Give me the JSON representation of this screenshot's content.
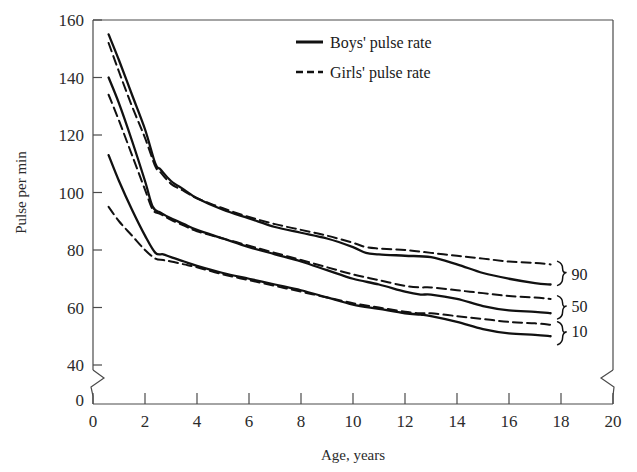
{
  "chart_data": {
    "type": "line",
    "title": "",
    "xlabel": "Age, years",
    "ylabel": "Pulse per min",
    "xlim": [
      0,
      20
    ],
    "ylim": [
      40,
      160
    ],
    "grid": false,
    "y_axis_break": true,
    "x_axis_break": true,
    "y_break_from": 0,
    "y_break_to": 40,
    "xticks": [
      0,
      2,
      4,
      6,
      8,
      10,
      12,
      14,
      16,
      18,
      20
    ],
    "xtick_labels": [
      "0",
      "2",
      "4",
      "6",
      "8",
      "10",
      "12",
      "14",
      "16",
      "18",
      "20"
    ],
    "yticks": [
      40,
      60,
      80,
      100,
      120,
      140,
      160
    ],
    "ytick_labels": [
      "40",
      "60",
      "80",
      "100",
      "120",
      "140",
      "160"
    ],
    "origin_label": "0",
    "legend": {
      "position": "top-center-right",
      "entries": [
        {
          "label": "Boys' pulse rate",
          "style": "solid"
        },
        {
          "label": "Girls' pulse rate",
          "style": "dashed"
        }
      ]
    },
    "band_labels": [
      {
        "text": "90",
        "percentile": 90
      },
      {
        "text": "50",
        "percentile": 50
      },
      {
        "text": "10",
        "percentile": 10
      }
    ],
    "series": [
      {
        "name": "Boys' pulse rate",
        "percentile": 90,
        "style": "solid",
        "x": [
          0.6,
          1.0,
          1.5,
          2.0,
          2.4,
          2.6,
          3.0,
          3.5,
          4.0,
          5.0,
          6.0,
          7.0,
          8.0,
          9.0,
          10.0,
          10.5,
          11.0,
          12.0,
          13.0,
          14.0,
          15.0,
          16.0,
          17.0,
          17.6
        ],
        "values": [
          155,
          146,
          134,
          122,
          110,
          108,
          104,
          101,
          98,
          94,
          91,
          88,
          86,
          84,
          81,
          79,
          78.5,
          78,
          77.5,
          75,
          72,
          70,
          68.5,
          68
        ]
      },
      {
        "name": "Girls' pulse rate",
        "percentile": 90,
        "style": "dashed",
        "x": [
          0.6,
          1.0,
          1.5,
          2.0,
          2.4,
          2.6,
          3.0,
          3.5,
          4.0,
          5.0,
          6.0,
          7.0,
          8.0,
          9.0,
          10.0,
          10.5,
          11.0,
          12.0,
          13.0,
          14.0,
          15.0,
          16.0,
          17.0,
          17.6
        ],
        "values": [
          152,
          142,
          130,
          119,
          109,
          107,
          103,
          100.5,
          98,
          94.5,
          91.5,
          89,
          87,
          85,
          82.5,
          81,
          80.5,
          80,
          79,
          78,
          77,
          76,
          75.5,
          75
        ]
      },
      {
        "name": "Boys' pulse rate",
        "percentile": 50,
        "style": "solid",
        "x": [
          0.6,
          1.0,
          1.5,
          2.0,
          2.3,
          2.6,
          3.0,
          3.5,
          4.0,
          5.0,
          6.0,
          7.0,
          8.0,
          9.0,
          10.0,
          11.0,
          12.0,
          12.6,
          13.0,
          14.0,
          15.0,
          16.0,
          17.0,
          17.6
        ],
        "values": [
          140,
          131,
          118,
          104,
          95,
          93,
          91,
          89,
          87,
          84,
          81,
          78.5,
          76,
          73,
          70,
          68,
          65.5,
          64.5,
          64.5,
          63,
          60.5,
          59,
          58.5,
          58
        ]
      },
      {
        "name": "Girls' pulse rate",
        "percentile": 50,
        "style": "dashed",
        "x": [
          0.6,
          1.0,
          1.5,
          2.0,
          2.3,
          2.6,
          3.0,
          3.5,
          4.0,
          5.0,
          6.0,
          7.0,
          8.0,
          9.0,
          10.0,
          11.0,
          12.0,
          12.6,
          13.0,
          14.0,
          15.0,
          16.0,
          17.0,
          17.6
        ],
        "values": [
          134,
          125,
          113,
          101,
          94,
          92.5,
          90.5,
          88.5,
          86.5,
          84,
          81.5,
          79,
          76.5,
          74,
          71.5,
          69.5,
          67.5,
          67,
          67,
          66,
          65,
          64,
          63.5,
          63
        ]
      },
      {
        "name": "Boys' pulse rate",
        "percentile": 10,
        "style": "solid",
        "x": [
          0.6,
          1.0,
          1.5,
          2.0,
          2.4,
          2.7,
          3.0,
          3.5,
          4.0,
          5.0,
          6.0,
          7.0,
          8.0,
          9.0,
          10.0,
          11.0,
          12.0,
          12.6,
          13.0,
          14.0,
          15.0,
          16.0,
          17.0,
          17.6
        ],
        "values": [
          113,
          104,
          94,
          85,
          79,
          78.5,
          77.5,
          76,
          74.5,
          72,
          70,
          68,
          66,
          63.5,
          61,
          59.5,
          58,
          57.5,
          57,
          55,
          52.5,
          51,
          50.5,
          50
        ]
      },
      {
        "name": "Girls' pulse rate",
        "percentile": 10,
        "style": "dashed",
        "x": [
          0.6,
          1.0,
          1.5,
          2.0,
          2.4,
          2.7,
          3.0,
          3.5,
          4.0,
          5.0,
          6.0,
          7.0,
          8.0,
          9.0,
          10.0,
          11.0,
          12.0,
          12.6,
          13.0,
          14.0,
          15.0,
          16.0,
          17.0,
          17.6
        ],
        "values": [
          95,
          90,
          85,
          80,
          77,
          76.5,
          76,
          75,
          74,
          71.5,
          69.5,
          67.5,
          65.5,
          63.5,
          61.5,
          60,
          58.5,
          58,
          58,
          57,
          56,
          55,
          54.5,
          54
        ]
      }
    ]
  },
  "style": {
    "line_color": "#111111",
    "axis_color": "#4a4a4a",
    "background": "#ffffff"
  }
}
